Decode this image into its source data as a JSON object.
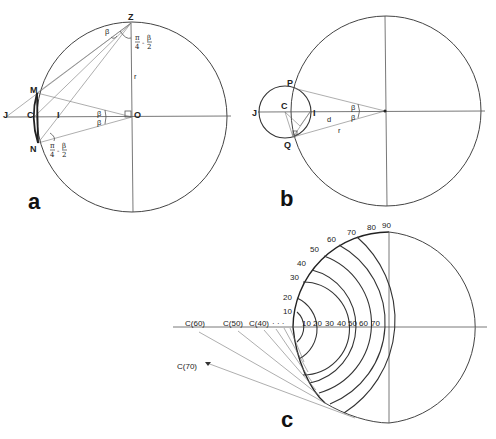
{
  "figure": {
    "panels": [
      {
        "id": "a",
        "label": "a",
        "points": {
          "Z": "Z",
          "M": "M",
          "J": "J",
          "C": "C",
          "I": "I",
          "N": "N",
          "O": "O"
        },
        "symbols": {
          "beta_top": "β",
          "beta_mid_upper": "β",
          "beta_mid_lower": "β",
          "radius": "r"
        },
        "angle_label_top": {
          "num1": "π",
          "den1": "4",
          "minus": "-",
          "num2": "β",
          "den2": "2"
        },
        "angle_label_bottom": {
          "num1": "π",
          "den1": "4",
          "minus": "-",
          "num2": "β",
          "den2": "2"
        }
      },
      {
        "id": "b",
        "label": "b",
        "points": {
          "P": "P",
          "J": "J",
          "C": "C",
          "I": "I",
          "Q": "Q"
        },
        "symbols": {
          "beta_upper": "β",
          "beta_lower": "β",
          "distance": "d",
          "radius": "r"
        }
      },
      {
        "id": "c",
        "label": "c",
        "rim_ticks": [
          "10",
          "20",
          "30",
          "40",
          "50",
          "60",
          "70",
          "80",
          "90"
        ],
        "axis_ticks": [
          "10",
          "20",
          "30",
          "40",
          "50",
          "60",
          "70"
        ],
        "centers": {
          "c60": "C(60)",
          "c50": "C(50)",
          "c40": "C(40)",
          "dots": "· · ·",
          "c70": "C(70)"
        }
      }
    ]
  }
}
